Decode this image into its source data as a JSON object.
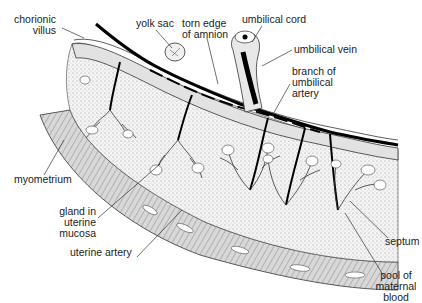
{
  "labels": {
    "chorionic_villus": [
      "chorionic",
      "villus"
    ],
    "yolk_sac": "yolk sac",
    "torn_edge": [
      "torn edge",
      "of amnion"
    ],
    "umbilical_cord": "umbilical cord",
    "umbilical_vein": "umbilical vein",
    "branch_artery": [
      "branch of",
      "umbilical",
      "artery"
    ],
    "myometrium": "myometrium",
    "gland": [
      "gland in",
      "uterine",
      "mucosa"
    ],
    "uterine_artery": "uterine artery",
    "septum": "septum",
    "pool": [
      "pool of",
      "maternal",
      "blood"
    ]
  },
  "colors": {
    "ink": "#1a1a1a",
    "tissue_light": "#e6e6e6",
    "tissue_mid": "#bdbdbd",
    "vessel": "#000000",
    "background": "#ffffff"
  }
}
